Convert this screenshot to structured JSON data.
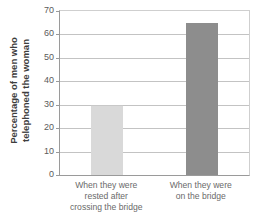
{
  "chart_data": {
    "type": "bar",
    "title": "",
    "xlabel": "",
    "ylabel": "Percentage of men who telephoned the woman",
    "ylabel_lines": [
      "Percentage of men who",
      "telephoned the woman"
    ],
    "categories": [
      "When they were rested after crossing the bridge",
      "When they were on the bridge"
    ],
    "category_lines": [
      [
        "When they were",
        "rested after",
        "crossing the bridge"
      ],
      [
        "When they were",
        "on the bridge"
      ]
    ],
    "values": [
      30,
      65
    ],
    "ylim": [
      0,
      70
    ],
    "yticks": [
      0,
      10,
      20,
      30,
      40,
      50,
      60,
      70
    ],
    "ytick_labels": [
      "0",
      "10",
      "20",
      "30",
      "40",
      "50",
      "60",
      "70"
    ],
    "grid": true,
    "legend": "none",
    "bar_colors": [
      "#d9d9d9",
      "#8d8d8d"
    ],
    "bar_border_colors": [
      "#c8c8c8",
      "#8d8d8d"
    ],
    "axis_color": "#9a9a9a",
    "gridline_color": "#c3c3c3",
    "background": "#ffffff"
  }
}
